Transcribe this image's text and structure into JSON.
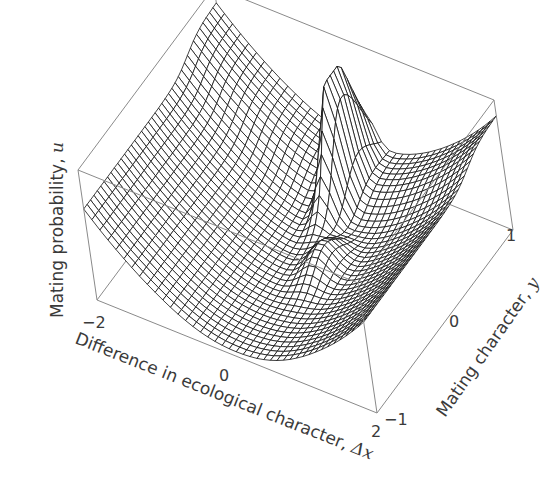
{
  "chart_data": {
    "type": "surface3d",
    "title": "",
    "axes": {
      "x": {
        "label": "Difference in ecological character, Δx",
        "label_text": "Difference in ecological character, ",
        "label_symbol": "Δx",
        "ticks": [
          "−2",
          "0",
          "2"
        ],
        "range": [
          -2,
          2
        ]
      },
      "y": {
        "label": "Mating character, y",
        "label_text": "Mating character, ",
        "label_symbol": "y",
        "ticks": [
          "−1",
          "0",
          "1"
        ],
        "range": [
          -1,
          1
        ]
      },
      "z": {
        "label": "Mating probability, u",
        "label_text": "Mating probability, ",
        "label_symbol": "u",
        "ticks": [],
        "range": [
          0,
          1
        ]
      }
    },
    "grid": false,
    "box": true,
    "mesh_color": "#111111",
    "box_color": "#8a8a8a"
  }
}
